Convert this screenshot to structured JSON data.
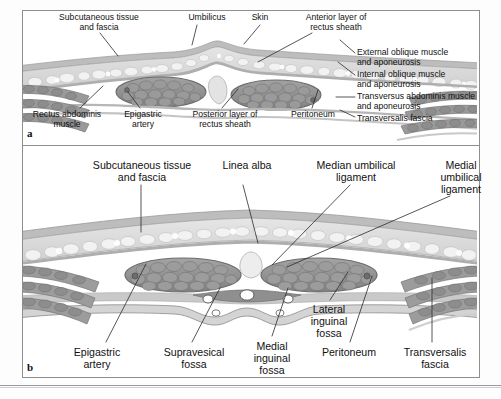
{
  "figure": {
    "type": "anatomical-illustration",
    "title_a": "a",
    "title_b": "b",
    "style": "grayscale medical illustration, transverse sections of the anterior abdominal wall",
    "colors": {
      "skin": "#c9c9c9",
      "subcutaneous_fat": "#d8d8d8",
      "fat_lobule": "#efefef",
      "fascia": "#b5b5b5",
      "muscle_dark": "#8a8a8a",
      "muscle_fascicle": "#9e9e9e",
      "rectus_outline": "#6e6e6e",
      "peritoneum": "#bdbdbd",
      "vessel_white": "#ffffff",
      "leader_line": "#2b2b2b",
      "frame": "#8e8e8e",
      "text": "#111111"
    }
  },
  "panel_a": {
    "letter": "a",
    "labels": {
      "subcutaneous": "Subcutaneous tissue\nand fascia",
      "umbilicus": "Umbilicus",
      "skin": "Skin",
      "anterior_layer": "Anterior layer of\nrectus sheath",
      "external_oblique": "External oblique muscle\nand aponeurosis",
      "internal_oblique": "Internal oblique muscle\nand aponeurosis",
      "transversus": "Transversus abdominis muscle\nand aponeurosis",
      "transversalis_fascia": "Transversalis fascia",
      "rectus_abdominis": "Rectus abdominis\nmuscle",
      "epigastric_artery": "Epigastric\nartery",
      "posterior_layer": "Posterior layer of\nrectus sheath",
      "peritoneum": "Peritoneum"
    }
  },
  "panel_b": {
    "letter": "b",
    "labels": {
      "subcutaneous": "Subcutaneous tissue\nand fascia",
      "linea_alba": "Linea alba",
      "median_umbilical": "Median umbilical\nligament",
      "medial_umbilical": "Medial\numbilical\nligament",
      "epigastric_artery": "Epigastric\nartery",
      "supravesical_fossa": "Supravesical\nfossa",
      "medial_inguinal_fossa": "Medial\ninguinal\nfossa",
      "lateral_inguinal_fossa": "Lateral\ninguinal\nfossa",
      "peritoneum": "Peritoneum",
      "transversalis_fascia": "Transversalis\nfascia"
    }
  }
}
